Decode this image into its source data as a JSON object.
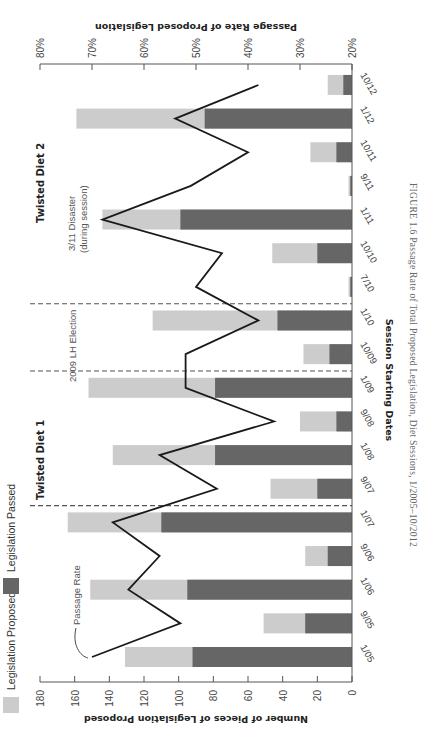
{
  "figure": {
    "caption": "FIGURE 1.6  Passage Rate of Total Proposed Legislation, Diet Sessions, 1/2005–10/2012",
    "orientation": "rotated 90° clockwise on page"
  },
  "legend": {
    "proposed_label": "Legislation Proposed",
    "passed_label": "Legislation Passed"
  },
  "annotations": {
    "passage_rate_label": "Passage Rate",
    "twisted_diet_1": "Twisted Diet 1",
    "twisted_diet_2": "Twisted Diet 2",
    "lh_election": "2009 LH Election",
    "disaster_line1": "3/11 Disaster",
    "disaster_line2": "(during session)"
  },
  "colors": {
    "proposed": "#cccccc",
    "passed": "#666666",
    "line": "#1a1a1a",
    "axis": "#555555",
    "dashed": "#555555"
  },
  "chart_data": {
    "type": "bar",
    "title": "Passage Rate of Total Proposed Legislation, Diet Sessions, 1/2005–10/2012",
    "xlabel": "Session Starting Dates",
    "ylabel": "Number of Pieces of Legislation Proposed",
    "y2label": "Passage Rate of Proposed Legislation",
    "ylim": [
      0,
      180
    ],
    "yticks": [
      0,
      20,
      40,
      60,
      80,
      100,
      120,
      140,
      160,
      180
    ],
    "y2lim": [
      20,
      80
    ],
    "y2ticks": [
      "20%",
      "30%",
      "40%",
      "50%",
      "60%",
      "70%",
      "80%"
    ],
    "categories": [
      "1/05",
      "9/05",
      "1/06",
      "9/06",
      "1/07",
      "9/07",
      "1/08",
      "9/08",
      "1/09",
      "10/09",
      "1/10",
      "7/10",
      "10/10",
      "1/11",
      "9/11",
      "10/11",
      "1/12",
      "10/12"
    ],
    "series": [
      {
        "name": "Legislation Proposed",
        "type": "bar",
        "axis": "left",
        "values": [
          131,
          51,
          151,
          27,
          164,
          47,
          138,
          30,
          152,
          28,
          115,
          2,
          46,
          144,
          2,
          24,
          159,
          14
        ]
      },
      {
        "name": "Legislation Passed",
        "type": "bar",
        "axis": "left",
        "values": [
          92,
          27,
          95,
          14,
          110,
          20,
          79,
          9,
          79,
          13,
          43,
          1,
          20,
          99,
          1,
          9,
          85,
          5
        ]
      },
      {
        "name": "Passage Rate",
        "type": "line",
        "axis": "right",
        "unit": "%",
        "values": [
          70,
          53,
          63,
          57,
          66,
          46,
          57,
          35,
          52,
          52,
          38,
          50,
          45,
          68,
          51,
          40,
          54,
          38
        ]
      }
    ],
    "vertical_markers": [
      {
        "between": [
          "1/07",
          "9/07"
        ],
        "label": "Twisted Diet 1"
      },
      {
        "between": [
          "1/09",
          "10/09"
        ],
        "label": "2009 LH Election"
      },
      {
        "between": [
          "1/10",
          "7/10"
        ],
        "label": "Twisted Diet 2"
      }
    ],
    "annotations": [
      {
        "at": "1/11",
        "text": "3/11 Disaster (during session)"
      },
      {
        "at": "1/05",
        "text": "Passage Rate",
        "target": "line"
      }
    ],
    "legend_position": "top-left (page orientation)",
    "grid": false
  }
}
